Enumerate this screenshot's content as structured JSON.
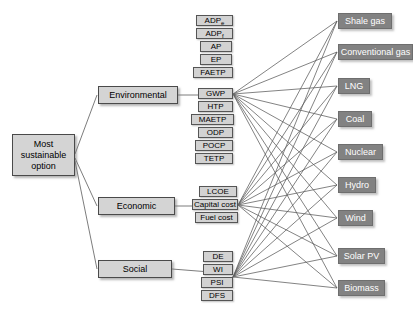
{
  "diagram": {
    "type": "hierarchy-tree",
    "title": "",
    "goal": {
      "label": "Most sustainable option",
      "line1": "Most",
      "line2": "sustainable",
      "line3": "option"
    },
    "criteria": [
      {
        "label": "Environmental"
      },
      {
        "label": "Economic"
      },
      {
        "label": "Social"
      }
    ],
    "indicators": {
      "environmental": [
        {
          "label": "ADPe",
          "base": "ADP",
          "sub": "e"
        },
        {
          "label": "ADPf",
          "base": "ADP",
          "sub": "f"
        },
        {
          "label": "AP",
          "base": "AP",
          "sub": ""
        },
        {
          "label": "EP",
          "base": "EP",
          "sub": ""
        },
        {
          "label": "FAETP",
          "base": "FAETP",
          "sub": ""
        },
        {
          "label": "GWP",
          "base": "GWP",
          "sub": ""
        },
        {
          "label": "HTP",
          "base": "HTP",
          "sub": ""
        },
        {
          "label": "MAETP",
          "base": "MAETP",
          "sub": ""
        },
        {
          "label": "ODP",
          "base": "ODP",
          "sub": ""
        },
        {
          "label": "POCP",
          "base": "POCP",
          "sub": ""
        },
        {
          "label": "TETP",
          "base": "TETP",
          "sub": ""
        }
      ],
      "economic": [
        {
          "label": "LCOE",
          "base": "LCOE",
          "sub": ""
        },
        {
          "label": "Capital cost",
          "base": "Capital cost",
          "sub": ""
        },
        {
          "label": "Fuel cost",
          "base": "Fuel cost",
          "sub": ""
        }
      ],
      "social": [
        {
          "label": "DE",
          "base": "DE",
          "sub": ""
        },
        {
          "label": "WI",
          "base": "WI",
          "sub": ""
        },
        {
          "label": "PSI",
          "base": "PSI",
          "sub": ""
        },
        {
          "label": "DFS",
          "base": "DFS",
          "sub": ""
        }
      ]
    },
    "technologies": [
      {
        "label": "Shale gas"
      },
      {
        "label": "Conventional gas"
      },
      {
        "label": "LNG"
      },
      {
        "label": "Coal"
      },
      {
        "label": "Nuclear"
      },
      {
        "label": "Hydro"
      },
      {
        "label": "Wind"
      },
      {
        "label": "Solar PV"
      },
      {
        "label": "Biomass"
      }
    ],
    "technologies_extra": [
      {
        "label": "Biomass"
      }
    ],
    "colors": {
      "goal_fill": "#d4d4d4",
      "criterion_fill": "#d4d4d4",
      "indicator_fill": "#d2d2d2",
      "technology_fill": "#828282",
      "technology_text": "#ffffff",
      "edge": "#5a5a5a",
      "background": "#ffffff"
    }
  }
}
